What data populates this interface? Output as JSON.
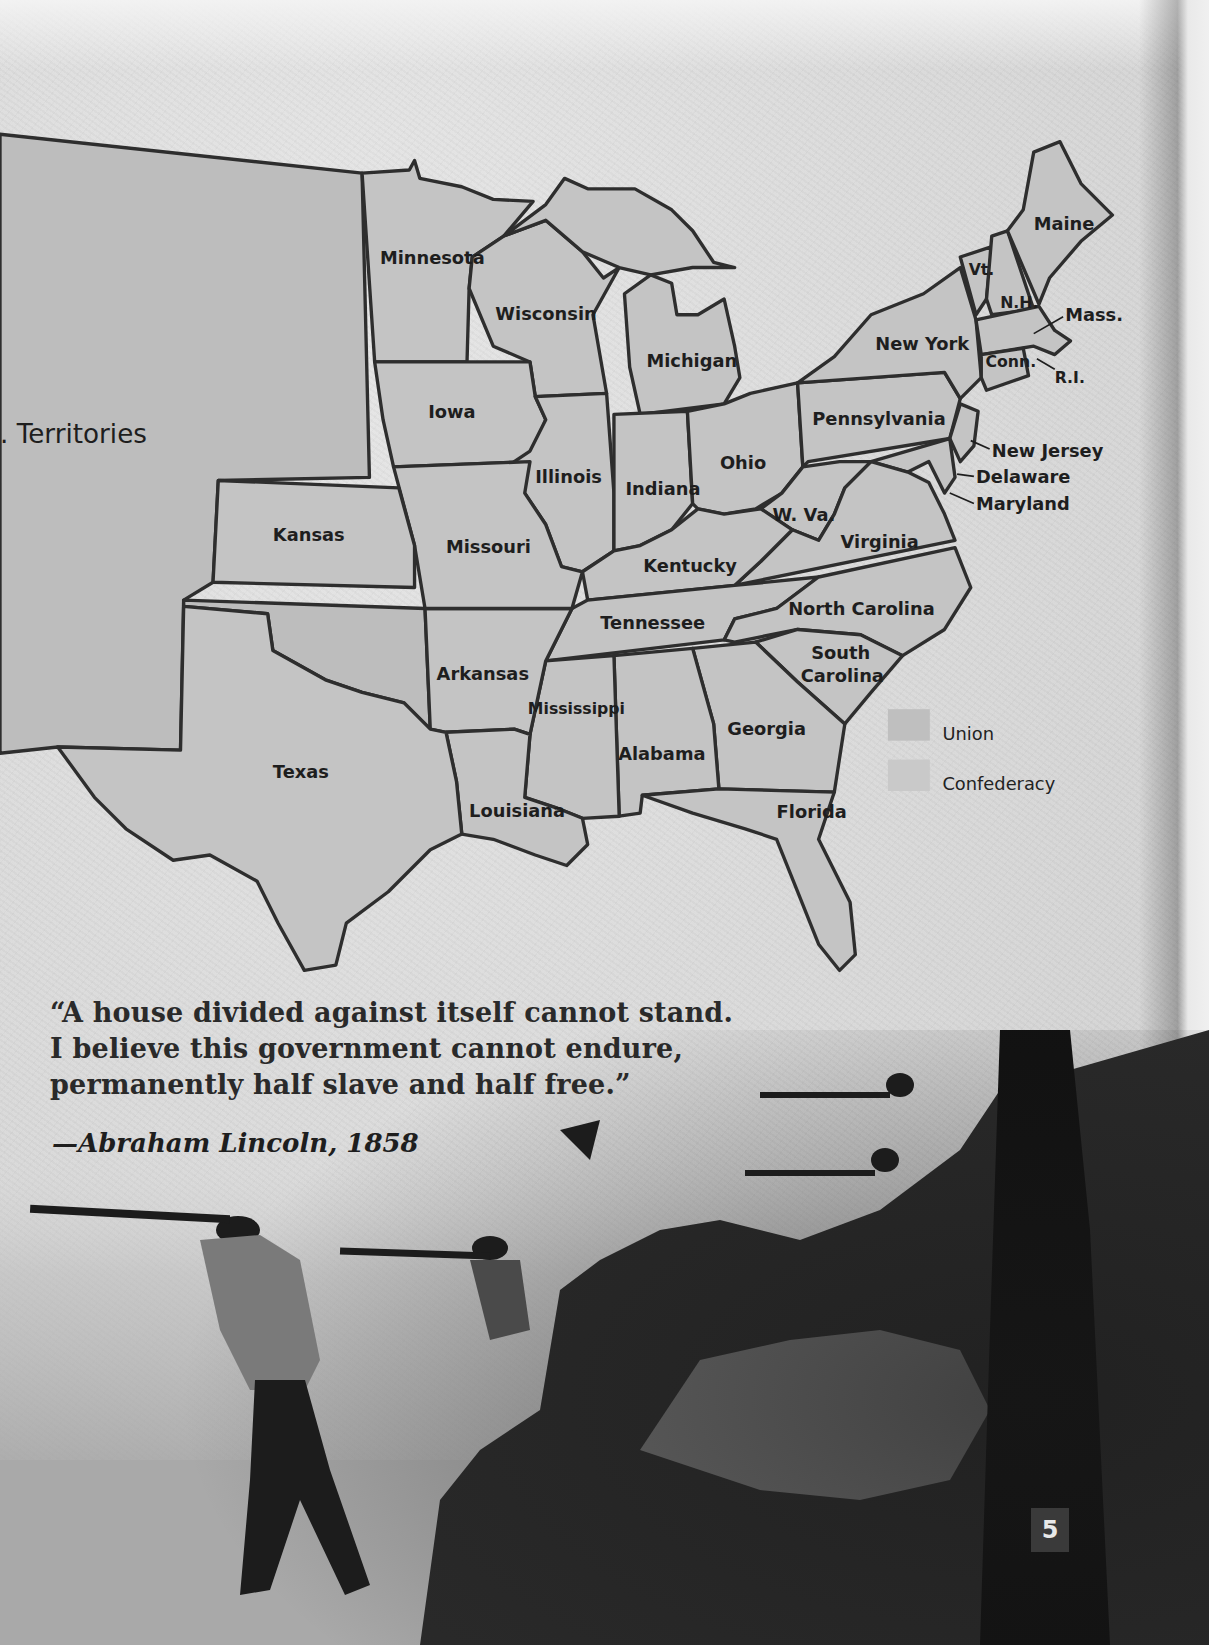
{
  "map": {
    "territory_label": ". Territories",
    "states": {
      "minnesota": "Minnesota",
      "wisconsin": "Wisconsin",
      "michigan": "Michigan",
      "iowa": "Iowa",
      "illinois": "Illinois",
      "indiana": "Indiana",
      "ohio": "Ohio",
      "kansas": "Kansas",
      "missouri": "Missouri",
      "kentucky": "Kentucky",
      "tennessee": "Tennessee",
      "arkansas": "Arkansas",
      "texas": "Texas",
      "louisiana": "Louisiana",
      "mississippi": "Mississippi",
      "alabama": "Alabama",
      "georgia": "Georgia",
      "florida": "Florida",
      "south_carolina_1": "South",
      "south_carolina_2": "Carolina",
      "north_carolina": "North Carolina",
      "virginia": "Virginia",
      "west_virginia": "W. Va.",
      "pennsylvania": "Pennsylvania",
      "new_york": "New York",
      "vermont": "Vt.",
      "new_hampshire": "N.H.",
      "maine": "Maine",
      "massachusetts": "Mass.",
      "connecticut": "Conn.",
      "rhode_island": "R.I.",
      "new_jersey": "New Jersey",
      "delaware": "Delaware",
      "maryland": "Maryland"
    },
    "legend": {
      "union": "Union",
      "confederacy": "Confederacy"
    }
  },
  "quote": {
    "line1": "“A house divided against itself cannot stand.",
    "line2": "I believe this government cannot endure,",
    "line3": "permanently half slave and half free.”",
    "attribution": "—Abraham Lincoln, 1858"
  },
  "page_number": "5"
}
